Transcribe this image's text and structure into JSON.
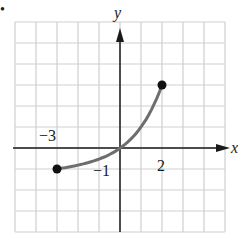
{
  "bullet": "•",
  "chart_data": {
    "type": "line",
    "title": "",
    "xlabel": "x",
    "ylabel": "y",
    "xlim": [
      -5,
      5
    ],
    "ylim": [
      -4,
      6
    ],
    "grid": true,
    "tick_labels": [
      {
        "text": "−3",
        "at": "x = -3 (above axis)"
      },
      {
        "text": "2",
        "at": "x = 2 (below axis)"
      },
      {
        "text": "−1",
        "at": "y = -1 (near y-axis)"
      }
    ],
    "series": [
      {
        "name": "curve",
        "x": [
          -3,
          -2,
          -1,
          0,
          1,
          2
        ],
        "y": [
          -0.875,
          -0.75,
          -0.5,
          0,
          1,
          3
        ],
        "endpoints": [
          {
            "x": -3,
            "y": -1,
            "closed": true
          },
          {
            "x": 2,
            "y": 3,
            "closed": true
          }
        ]
      }
    ],
    "colors": {
      "curve": "#6e6e6e",
      "points": "#111111",
      "axes": "#1a1a1a",
      "grid": "#cfcfcf"
    }
  },
  "labels": {
    "x_axis": "x",
    "y_axis": "y",
    "neg3": "−3",
    "pos2": "2",
    "neg1": "−1"
  }
}
